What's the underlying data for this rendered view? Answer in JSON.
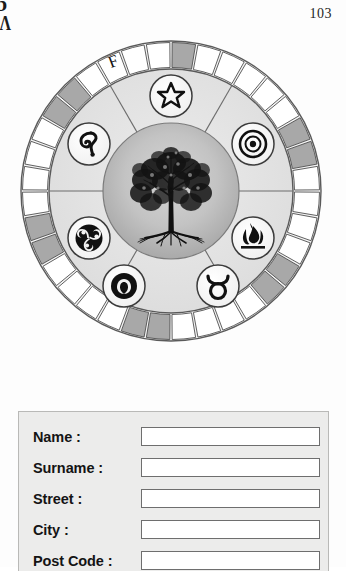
{
  "page": {
    "number": "103",
    "edge_marks": [
      "b",
      "Λ"
    ]
  },
  "mandala": {
    "name": "tree-of-life-wheel",
    "outer_ring": {
      "label": "F",
      "segment_count": 36,
      "white_color": "#ffffff",
      "gray_color": "#a8a8a8",
      "pattern": [
        "gray",
        "white",
        "white",
        "white",
        "white",
        "white",
        "gray",
        "gray",
        "white",
        "white",
        "white",
        "white",
        "gray",
        "gray",
        "white",
        "white",
        "white",
        "white",
        "gray",
        "gray",
        "white",
        "white",
        "white",
        "white",
        "gray",
        "gray",
        "white",
        "white",
        "white",
        "white",
        "gray",
        "gray",
        "white",
        "white",
        "white",
        "white"
      ]
    },
    "middle_ring": {
      "background": "#e3e3e3",
      "spoke_count": 6,
      "symbols": [
        {
          "name": "pentagram-star-icon",
          "label": "Star",
          "angle": 270
        },
        {
          "name": "sun-circle-dot-icon",
          "label": "Sun",
          "angle": 330
        },
        {
          "name": "flame-fire-icon",
          "label": "Fire",
          "angle": 30
        },
        {
          "name": "taurus-zodiac-icon",
          "label": "Taurus",
          "angle": 90
        },
        {
          "name": "eye-seed-icon",
          "label": "Eye",
          "angle": 150
        },
        {
          "name": "triskelion-spiral-icon",
          "label": "Triskelion",
          "angle": 210
        },
        {
          "name": "serpent-spiral-icon",
          "label": "Spiral",
          "angle": 250
        }
      ]
    },
    "center": {
      "name": "tree-of-life",
      "background": "#b4b4b4"
    }
  },
  "form": {
    "title": "address-form",
    "fields": [
      {
        "label": "Name :",
        "value": "",
        "placeholder": ""
      },
      {
        "label": "Surname :",
        "value": "",
        "placeholder": ""
      },
      {
        "label": "Street :",
        "value": "",
        "placeholder": ""
      },
      {
        "label": "City :",
        "value": "",
        "placeholder": ""
      },
      {
        "label": "Post Code :",
        "value": "",
        "placeholder": ""
      }
    ]
  }
}
